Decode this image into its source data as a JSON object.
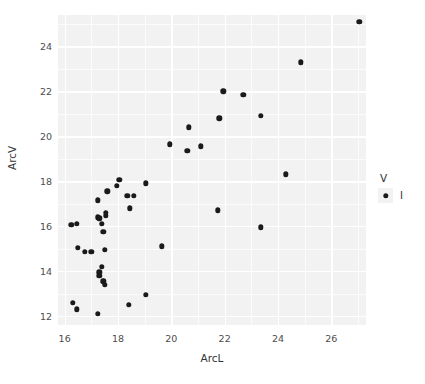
{
  "chart_data": {
    "type": "scatter",
    "title": "",
    "xlabel": "ArcL",
    "ylabel": "ArcV",
    "xlim": [
      15.75,
      27.3
    ],
    "ylim": [
      11.6,
      25.4
    ],
    "xticks": [
      16,
      18,
      20,
      22,
      24,
      26
    ],
    "yticks": [
      12,
      14,
      16,
      18,
      20,
      22,
      24
    ],
    "grid": true,
    "legend": {
      "position": "right",
      "title": "V",
      "entries": [
        {
          "label": "I",
          "marker": "circle",
          "color": "#1a1a1a"
        }
      ]
    },
    "series": [
      {
        "name": "I",
        "color": "#1a1a1a",
        "points": [
          {
            "x": 27.05,
            "y": 25.1
          },
          {
            "x": 24.85,
            "y": 23.3
          },
          {
            "x": 21.95,
            "y": 22.0
          },
          {
            "x": 22.7,
            "y": 21.85
          },
          {
            "x": 23.35,
            "y": 20.9
          },
          {
            "x": 21.8,
            "y": 20.8
          },
          {
            "x": 20.65,
            "y": 20.4
          },
          {
            "x": 19.95,
            "y": 19.65
          },
          {
            "x": 21.1,
            "y": 19.55
          },
          {
            "x": 20.6,
            "y": 19.35
          },
          {
            "x": 24.3,
            "y": 18.3
          },
          {
            "x": 18.05,
            "y": 18.05
          },
          {
            "x": 19.05,
            "y": 17.9
          },
          {
            "x": 17.95,
            "y": 17.8
          },
          {
            "x": 17.6,
            "y": 17.55
          },
          {
            "x": 18.35,
            "y": 17.35
          },
          {
            "x": 18.6,
            "y": 17.35
          },
          {
            "x": 17.25,
            "y": 17.15
          },
          {
            "x": 18.45,
            "y": 16.8
          },
          {
            "x": 21.75,
            "y": 16.7
          },
          {
            "x": 17.55,
            "y": 16.6
          },
          {
            "x": 17.55,
            "y": 16.45
          },
          {
            "x": 17.25,
            "y": 16.4
          },
          {
            "x": 17.3,
            "y": 16.35
          },
          {
            "x": 16.25,
            "y": 16.05
          },
          {
            "x": 16.45,
            "y": 16.1
          },
          {
            "x": 23.35,
            "y": 15.95
          },
          {
            "x": 17.4,
            "y": 16.1
          },
          {
            "x": 17.45,
            "y": 15.75
          },
          {
            "x": 19.65,
            "y": 15.1
          },
          {
            "x": 16.5,
            "y": 15.05
          },
          {
            "x": 17.5,
            "y": 14.95
          },
          {
            "x": 16.75,
            "y": 14.85
          },
          {
            "x": 17.0,
            "y": 14.85
          },
          {
            "x": 17.4,
            "y": 14.2
          },
          {
            "x": 17.3,
            "y": 13.95
          },
          {
            "x": 17.3,
            "y": 13.8
          },
          {
            "x": 17.45,
            "y": 13.55
          },
          {
            "x": 17.5,
            "y": 13.4
          },
          {
            "x": 19.05,
            "y": 12.95
          },
          {
            "x": 16.3,
            "y": 12.6
          },
          {
            "x": 18.4,
            "y": 12.5
          },
          {
            "x": 16.45,
            "y": 12.3
          },
          {
            "x": 17.25,
            "y": 12.1
          }
        ]
      }
    ]
  }
}
